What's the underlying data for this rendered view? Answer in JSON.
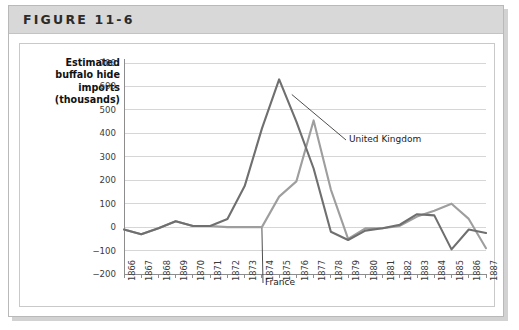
{
  "figure": {
    "title": "FIGURE 11-6"
  },
  "chart_data": {
    "type": "line",
    "title": "",
    "ylabel": "Estimated buffalo hide imports (thousands)",
    "xlabel": "",
    "ylim": [
      -200,
      700
    ],
    "ytick_step": 100,
    "yticks": [
      "700",
      "600",
      "500",
      "400",
      "300",
      "200",
      "100",
      "0",
      "-100",
      "-200"
    ],
    "grid": true,
    "legend_position": "inline-annotations",
    "categories": [
      "1866",
      "1867",
      "1868",
      "1869",
      "1870",
      "1871",
      "1872",
      "1873",
      "1874",
      "1875",
      "1876",
      "1877",
      "1878",
      "1879",
      "1880",
      "1881",
      "1882",
      "1883",
      "1884",
      "1885",
      "1886",
      "1887"
    ],
    "series": [
      {
        "name": "United Kingdom",
        "color": "#6f6f6f",
        "values": [
          -10,
          -30,
          -5,
          25,
          5,
          5,
          35,
          175,
          420,
          630,
          450,
          250,
          -20,
          -55,
          -15,
          -5,
          10,
          55,
          50,
          -95,
          -10,
          -25
        ]
      },
      {
        "name": "France",
        "color": "#9e9e9e",
        "values": [
          -10,
          -30,
          -5,
          25,
          5,
          5,
          0,
          0,
          0,
          130,
          195,
          455,
          160,
          -50,
          -5,
          -5,
          5,
          45,
          70,
          100,
          35,
          -90
        ]
      }
    ],
    "annotations": [
      {
        "text": "United Kingdom",
        "series": "United Kingdom"
      },
      {
        "text": "France",
        "series": "France"
      }
    ]
  }
}
